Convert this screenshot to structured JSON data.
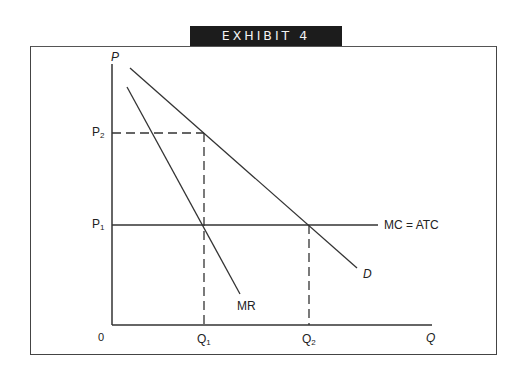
{
  "title": "EXHIBIT 4",
  "axes": {
    "y_label": "P",
    "x_label": "Q",
    "origin_label": "0"
  },
  "price_ticks": [
    {
      "base": "P",
      "sub": "2"
    },
    {
      "base": "P",
      "sub": "1"
    }
  ],
  "quantity_ticks": [
    {
      "base": "Q",
      "sub": "1"
    },
    {
      "base": "Q",
      "sub": "2"
    }
  ],
  "curves": {
    "demand": "D",
    "marginal_revenue": "MR",
    "cost": "MC = ATC"
  },
  "colors": {
    "banner_bg": "#1c1c1c",
    "banner_text": "#f2f2f2",
    "line": "#333333"
  }
}
